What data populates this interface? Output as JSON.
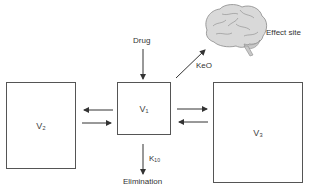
{
  "diagram": {
    "nodes": {
      "drug": "Drug",
      "v1": "V₁",
      "v2": "V₂",
      "v3": "V₃",
      "effect_site": "Effect site",
      "elimination": "Elimination"
    },
    "edges": {
      "ke0": "KeO",
      "k10": "K₁₀"
    },
    "icons": {
      "brain": "brain-icon"
    },
    "colors": {
      "line": "#333333",
      "box_border": "#555555",
      "brain_fill": "#d9d9d9",
      "brain_stroke": "#8a8a8a"
    }
  }
}
